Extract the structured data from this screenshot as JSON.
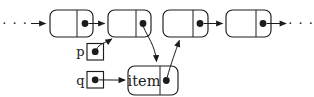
{
  "figure": {
    "kind": "linked-list insertion diagram",
    "background_color": "#ffffff",
    "line_color": "#1c1c1c",
    "ellipsis_left": "· · ·",
    "ellipsis_right": "· · ·",
    "pointer_p_label": "p",
    "pointer_q_label": "q",
    "new_node_label": "item",
    "list_nodes": [
      {
        "name": "node-1",
        "has_next_dot": true
      },
      {
        "name": "node-2",
        "has_next_dot": true
      },
      {
        "name": "node-3",
        "has_next_dot": true
      },
      {
        "name": "node-4",
        "has_next_dot": true
      }
    ],
    "arrows": [
      {
        "from": "ellipsis-left",
        "to": "node-1"
      },
      {
        "from": "node-1-next-dot",
        "to": "node-2"
      },
      {
        "from": "node-2-next-dot",
        "to": "item-node-top"
      },
      {
        "from": "node-3-next-dot",
        "to": "node-4"
      },
      {
        "from": "node-4-next-dot",
        "to": "ellipsis-right"
      },
      {
        "from": "pointer-p-dot",
        "to": "node-2-bottom"
      },
      {
        "from": "pointer-q-dot",
        "to": "item-node-left"
      },
      {
        "from": "item-node-next-dot",
        "to": "node-3-bottom"
      }
    ]
  }
}
